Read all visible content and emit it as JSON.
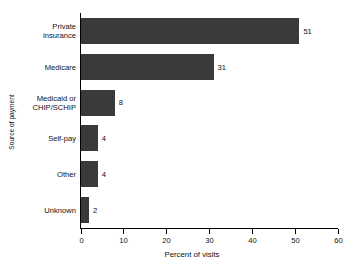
{
  "chart_data": {
    "type": "bar",
    "orientation": "horizontal",
    "title": "",
    "xlabel": "Percent of visits",
    "ylabel": "Source of payment",
    "categories": [
      "Private insurance",
      "Medicare",
      "Medicaid or CHIP/SCHIP",
      "Self-pay",
      "Other",
      "Unknown"
    ],
    "category_lines": [
      [
        "Private",
        "insurance"
      ],
      [
        "Medicare"
      ],
      [
        "Medicaid or",
        "CHIP/SCHIP"
      ],
      [
        "Self-pay"
      ],
      [
        "Other"
      ],
      [
        "Unknown"
      ]
    ],
    "values": [
      51,
      31,
      8,
      4,
      4,
      2
    ],
    "value_labels": [
      "51",
      "31",
      "8",
      "4",
      "4",
      "2"
    ],
    "xlim": [
      0,
      60
    ],
    "xticks": [
      0,
      10,
      20,
      30,
      40,
      50,
      60
    ],
    "xtick_labels": [
      "0",
      "10",
      "20",
      "30",
      "40",
      "50",
      "60"
    ],
    "grid": false,
    "legend": false,
    "bar_color": "#3a3a3a",
    "axis_color": "#000000",
    "background_color": "#ffffff"
  }
}
